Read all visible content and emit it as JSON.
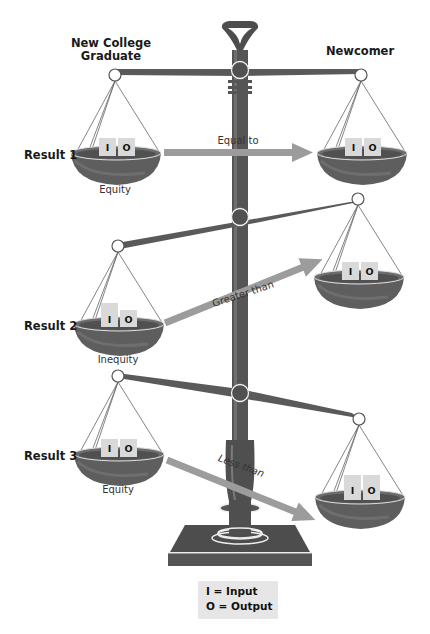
{
  "headers": {
    "left": [
      "New College",
      "Graduate"
    ],
    "right": "Newcomer"
  },
  "results": [
    {
      "label": "Result 1",
      "left_caption": "Equity",
      "comparison": "Equal to"
    },
    {
      "label": "Result 2",
      "left_caption": "Inequity",
      "comparison": "Greater than"
    },
    {
      "label": "Result 3",
      "left_caption": "Equity",
      "comparison": "Less than"
    }
  ],
  "box_labels": {
    "input": "I",
    "output": "O"
  },
  "legend": {
    "input_line": "I = Input",
    "output_line": "O = Output"
  },
  "colors": {
    "metal": "#5a5a5a",
    "metal_dark": "#3f3f3f",
    "pan": "#6b6b6b",
    "pan_inner": "#8a8a8a",
    "arrow": "#9a9a9a",
    "box": "#d8d8d8",
    "legend_bg": "#e6e6e6"
  }
}
